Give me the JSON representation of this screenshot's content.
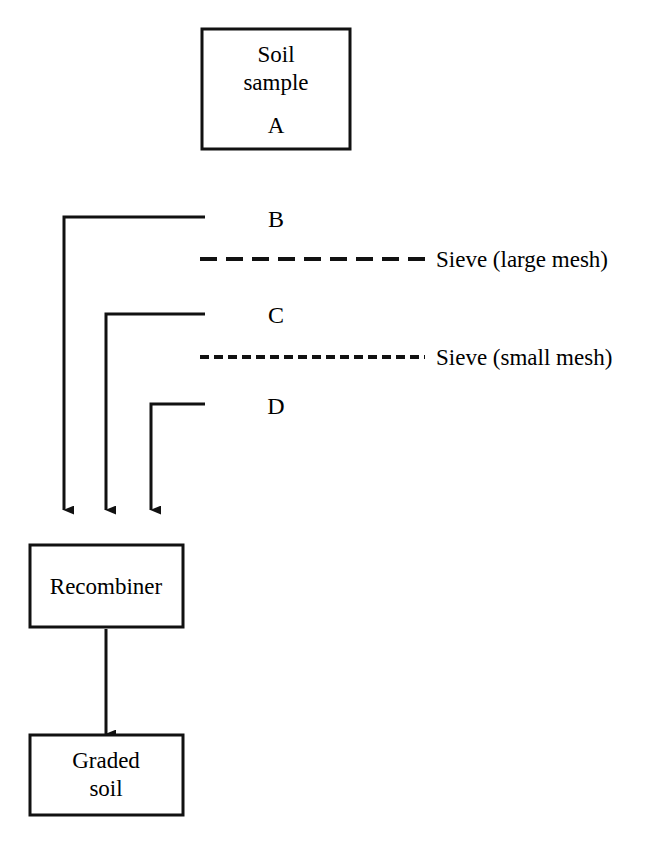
{
  "diagram": {
    "colors": {
      "stroke": "#111111",
      "background": "#ffffff",
      "text": "#000000"
    },
    "boxes": [
      {
        "id": "soil-sample",
        "line1": "Soil",
        "line2": "sample",
        "letter": "A"
      },
      {
        "id": "recombiner",
        "line1": "Recombiner",
        "line2": "",
        "letter": ""
      },
      {
        "id": "graded-soil",
        "line1": "Graded",
        "line2": "soil",
        "letter": ""
      }
    ],
    "streams": [
      {
        "id": "stream-b",
        "label": "B"
      },
      {
        "id": "stream-c",
        "label": "C"
      },
      {
        "id": "stream-d",
        "label": "D"
      }
    ],
    "sieves": [
      {
        "id": "sieve-large",
        "label": "Sieve (large mesh)",
        "mesh": "large"
      },
      {
        "id": "sieve-small",
        "label": "Sieve (small mesh)",
        "mesh": "small"
      }
    ]
  }
}
